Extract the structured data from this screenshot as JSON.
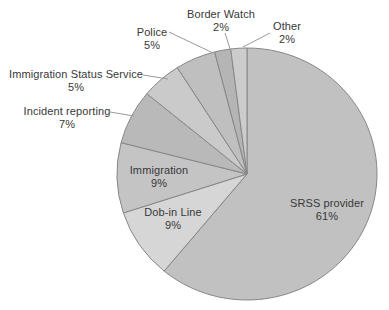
{
  "chart_data": {
    "type": "pie",
    "direction": "clockwise",
    "start_angle_deg": 0,
    "start_position": "12-oclock",
    "legend": "none",
    "stroke_color": "#878787",
    "leader_line_color": "#9a9a9a",
    "background": "#ffffff",
    "segments": [
      {
        "label": "SRSS provider",
        "value": 61,
        "pct_label": "61%",
        "color": "#c1c1c1",
        "label_placement": "inside"
      },
      {
        "label": "Dob-in Line",
        "value": 9,
        "pct_label": "9%",
        "color": "#d6d6d6",
        "label_placement": "inside"
      },
      {
        "label": "Immigration",
        "value": 9,
        "pct_label": "9%",
        "color": "#c4c4c4",
        "label_placement": "inside"
      },
      {
        "label": "Incident reporting",
        "value": 7,
        "pct_label": "7%",
        "color": "#b9b9b9",
        "label_placement": "outside"
      },
      {
        "label": "Immigration Status Service",
        "value": 5,
        "pct_label": "5%",
        "color": "#cacaca",
        "label_placement": "outside"
      },
      {
        "label": "Police",
        "value": 5,
        "pct_label": "5%",
        "color": "#bfbfbf",
        "label_placement": "outside"
      },
      {
        "label": "Border Watch",
        "value": 2,
        "pct_label": "2%",
        "color": "#b5b5b5",
        "label_placement": "outside"
      },
      {
        "label": "Other",
        "value": 2,
        "pct_label": "2%",
        "color": "#cccccc",
        "label_placement": "outside"
      }
    ]
  }
}
